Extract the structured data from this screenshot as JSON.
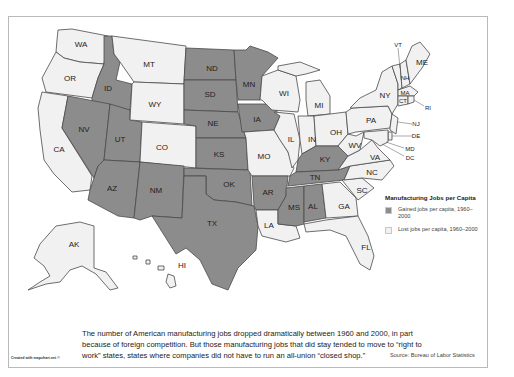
{
  "map": {
    "title": "Manufacturing Jobs per Capita",
    "colors": {
      "gained": "#8c8c8c",
      "lost": "#f1f1f1",
      "border": "#4a4a4a",
      "frame": "#b9b9b9"
    },
    "states": {
      "WA": "lost",
      "OR": "lost",
      "CA": "lost",
      "ID": "gained",
      "NV": "gained",
      "UT": "gained",
      "AZ": "gained",
      "MT": "lost",
      "WY": "lost",
      "CO": "lost",
      "NM": "gained",
      "ND": "gained",
      "SD": "gained",
      "NE": "gained",
      "KS": "gained",
      "OK": "gained",
      "TX": "gained",
      "MN": "gained",
      "IA": "gained",
      "MO": "lost",
      "AR": "gained",
      "LA": "lost",
      "WI": "lost",
      "IL": "lost",
      "MI": "lost",
      "IN": "lost",
      "OH": "lost",
      "KY": "gained",
      "TN": "gained",
      "MS": "gained",
      "AL": "gained",
      "GA": "lost",
      "FL": "lost",
      "SC": "lost",
      "NC": "lost",
      "VA": "lost",
      "WV": "lost",
      "PA": "lost",
      "NY": "lost",
      "VT": "lost",
      "NH": "lost",
      "ME": "lost",
      "MA": "lost",
      "CT": "lost",
      "RI": "lost",
      "NJ": "lost",
      "DE": "lost",
      "MD": "lost",
      "DC": "lost",
      "AK": "lost",
      "HI": "lost"
    },
    "labels": {
      "WA": "WA",
      "OR": "OR",
      "CA": "CA",
      "ID": "ID",
      "NV": "NV",
      "UT": "UT",
      "AZ": "AZ",
      "MT": "MT",
      "WY": "WY",
      "CO": "CO",
      "NM": "NM",
      "ND": "ND",
      "SD": "SD",
      "NE": "NE",
      "KS": "KS",
      "OK": "OK",
      "TX": "TX",
      "MN": "MN",
      "IA": "IA",
      "MO": "MO",
      "AR": "AR",
      "LA": "LA",
      "WI": "WI",
      "IL": "IL",
      "MI": "MI",
      "IN": "IN",
      "OH": "OH",
      "KY": "KY",
      "TN": "TN",
      "MS": "MS",
      "AL": "AL",
      "GA": "GA",
      "FL": "FL",
      "SC": "SC",
      "NC": "NC",
      "VA": "VA",
      "WV": "WV",
      "PA": "PA",
      "NY": "NY",
      "VT": "VT",
      "NH": "NH",
      "ME": "ME",
      "MA": "MA",
      "CT": "CT",
      "RI": "RI",
      "NJ": "NJ",
      "DE": "DE",
      "MD": "MD",
      "DC": "DC",
      "AK": "AK",
      "HI": "HI"
    }
  },
  "legend": {
    "title": "Manufacturing Jobs per Capita",
    "items": [
      {
        "label": "Gained jobs per capita, 1960–2000",
        "color": "#8c8c8c"
      },
      {
        "label": "Lost jobs per capita, 1960–2000",
        "color": "#f1f1f1"
      }
    ]
  },
  "caption": "The number of American manufacturing jobs dropped dramatically between 1960 and 2000, in part because of foreign competition. But those manufacturing jobs that did stay tended to move to “right to work” states, states where companies did not have to run an all-union “closed shop.”",
  "credit": "Created with mapchart.net ©",
  "source": "Source: Bureau of Labor Statistics"
}
